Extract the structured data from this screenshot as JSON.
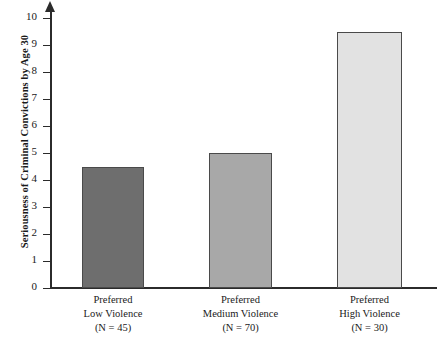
{
  "chart_data": {
    "type": "bar",
    "title": "",
    "xlabel": "",
    "ylabel": "Seriousness of Criminal Convictions by Age 30",
    "ylim": [
      0,
      10
    ],
    "grid": false,
    "legend": "none",
    "categories": [
      "Preferred Low Violence",
      "Preferred Medium Violence",
      "Preferred High Violence"
    ],
    "values": [
      4.5,
      5.0,
      9.5
    ],
    "ytick_labels": [
      "0",
      "1",
      "2",
      "3",
      "4",
      "5",
      "6",
      "7",
      "8",
      "9",
      "10"
    ],
    "ytick_values": [
      0,
      1,
      2,
      3,
      4,
      5,
      6,
      7,
      8,
      9,
      10
    ],
    "bars": [
      {
        "label_line1": "Preferred",
        "label_line2": "Low Violence",
        "label_line3": "(N = 45)",
        "value": 4.5,
        "n": 45,
        "color": "#6e6e6e",
        "border_color": "#4a4a4a"
      },
      {
        "label_line1": "Preferred",
        "label_line2": "Medium Violence",
        "label_line3": "(N = 70)",
        "value": 5.0,
        "n": 70,
        "color": "#a8a8a8",
        "border_color": "#4a4a4a"
      },
      {
        "label_line1": "Preferred",
        "label_line2": "High Violence",
        "label_line3": "(N = 30)",
        "value": 9.5,
        "n": 30,
        "color": "#e2e2e2",
        "border_color": "#4a4a4a"
      }
    ],
    "axis_color": "#2b2b2b"
  }
}
